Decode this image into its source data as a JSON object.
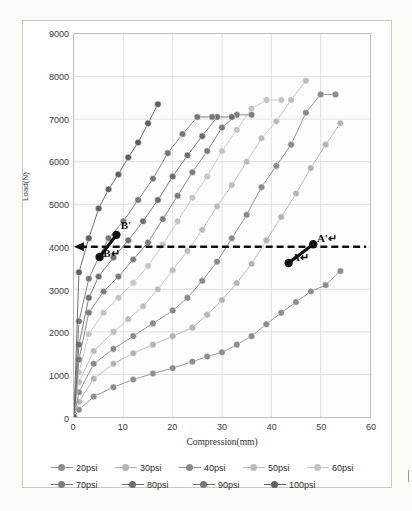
{
  "scan_artifact_text": "",
  "chart_data": {
    "type": "line",
    "title": "",
    "xlabel": "Compression(mm)",
    "ylabel": "Load(N)",
    "xlim": [
      0,
      60
    ],
    "ylim": [
      0,
      9000
    ],
    "xticks": [
      0,
      10,
      20,
      30,
      40,
      50,
      60
    ],
    "yticks": [
      0,
      1000,
      2000,
      3000,
      4000,
      5000,
      6000,
      7000,
      8000,
      9000
    ],
    "grid": true,
    "legend_position": "bottom",
    "series": [
      {
        "name": "20psi",
        "color": "#8d8d8d",
        "x": [
          0,
          1,
          4,
          8,
          12,
          16,
          20,
          24,
          27,
          30,
          33,
          36,
          39,
          42,
          45,
          48,
          51,
          54
        ],
        "values": [
          0,
          170,
          480,
          700,
          880,
          1020,
          1150,
          1300,
          1420,
          1520,
          1700,
          1900,
          2180,
          2450,
          2700,
          2950,
          3100,
          3430
        ]
      },
      {
        "name": "30psi",
        "color": "#b4b4b4",
        "x": [
          0,
          1,
          4,
          8,
          12,
          16,
          20,
          24,
          27,
          30,
          33,
          36,
          39,
          42,
          45,
          48,
          51,
          54
        ],
        "values": [
          0,
          360,
          900,
          1250,
          1500,
          1700,
          1900,
          2100,
          2400,
          2750,
          3150,
          3600,
          4150,
          4700,
          5250,
          5850,
          6400,
          6900
        ]
      },
      {
        "name": "40psi",
        "color": "#8a8a8a",
        "x": [
          0,
          1,
          4,
          8,
          12,
          16,
          20,
          23,
          26,
          29,
          32,
          35,
          38,
          41,
          44,
          47,
          50,
          53
        ],
        "values": [
          0,
          580,
          1250,
          1600,
          1900,
          2200,
          2500,
          2800,
          3200,
          3650,
          4200,
          4750,
          5400,
          5900,
          6400,
          7150,
          7580,
          7580
        ]
      },
      {
        "name": "50psi",
        "color": "#bdbdbd",
        "x": [
          0,
          1,
          4,
          8,
          11,
          14,
          17,
          20,
          23,
          26,
          29,
          32,
          35,
          38,
          41,
          44,
          47
        ],
        "values": [
          0,
          820,
          1550,
          2000,
          2300,
          2600,
          3000,
          3450,
          3900,
          4400,
          4950,
          5450,
          6000,
          6550,
          6950,
          7450,
          7900
        ]
      },
      {
        "name": "60psi",
        "color": "#c4c4c4",
        "x": [
          0,
          1,
          3,
          6,
          9,
          12,
          15,
          18,
          21,
          24,
          27,
          30,
          33,
          36,
          39,
          42
        ],
        "values": [
          0,
          1050,
          1950,
          2450,
          2800,
          3150,
          3550,
          4050,
          4600,
          5150,
          5650,
          6250,
          6750,
          7250,
          7450,
          7450
        ]
      },
      {
        "name": "70psi",
        "color": "#7c7c7c",
        "x": [
          0,
          1,
          3,
          6,
          9,
          12,
          15,
          18,
          21,
          24,
          27,
          30,
          33,
          36
        ],
        "values": [
          0,
          1350,
          2450,
          2950,
          3300,
          3700,
          4100,
          4650,
          5200,
          5750,
          6250,
          6800,
          7100,
          7100
        ]
      },
      {
        "name": "80psi",
        "color": "#6e6e6e",
        "x": [
          0,
          1,
          3,
          5,
          8,
          11,
          14,
          17,
          20,
          23,
          26,
          29,
          32
        ],
        "values": [
          0,
          1700,
          2800,
          3300,
          3750,
          4150,
          4600,
          5100,
          5650,
          6150,
          6600,
          7050,
          7050
        ]
      },
      {
        "name": "90psi",
        "color": "#777777",
        "x": [
          0,
          1,
          3,
          5,
          7,
          10,
          13,
          16,
          19,
          22,
          25,
          28
        ],
        "values": [
          0,
          2250,
          3250,
          3750,
          4200,
          4600,
          5100,
          5600,
          6200,
          6650,
          7050,
          7050
        ]
      },
      {
        "name": "100psi",
        "color": "#5f5f5f",
        "x": [
          0,
          1,
          3,
          5,
          7,
          9,
          11,
          13,
          15,
          17
        ],
        "values": [
          0,
          3400,
          4200,
          4900,
          5350,
          5700,
          6100,
          6450,
          6900,
          7350
        ]
      }
    ],
    "reference_line": {
      "label": "",
      "y": 4000,
      "style": "dashed",
      "color": "#111111",
      "arrow": "left"
    },
    "annotations": [
      {
        "label": "A↵",
        "x": 43.5,
        "y": 3620
      },
      {
        "label": "A'↵",
        "x": 48.5,
        "y": 4060
      },
      {
        "label": "B↵",
        "x": 5.5,
        "y": 3720
      },
      {
        "label": "B'",
        "x": 9.0,
        "y": 4380
      }
    ],
    "highlight_segments": [
      {
        "name": "segment-A",
        "x1": 43.5,
        "y1": 3620,
        "x2": 48.5,
        "y2": 4060,
        "color": "#111111"
      },
      {
        "name": "segment-B",
        "x1": 5.2,
        "y1": 3760,
        "x2": 8.6,
        "y2": 4280,
        "color": "#111111"
      }
    ]
  },
  "legend": {
    "rows": [
      [
        {
          "label": "20psi",
          "color": "#8d8d8d"
        },
        {
          "label": "30psi",
          "color": "#b4b4b4"
        },
        {
          "label": "40psi",
          "color": "#8a8a8a"
        },
        {
          "label": "50psi",
          "color": "#bdbdbd"
        },
        {
          "label": "60psi",
          "color": "#c4c4c4"
        }
      ],
      [
        {
          "label": "70psi",
          "color": "#7c7c7c"
        },
        {
          "label": "80psi",
          "color": "#6e6e6e"
        },
        {
          "label": "90psi",
          "color": "#777777"
        },
        {
          "label": "100psi",
          "color": "#5f5f5f"
        }
      ]
    ]
  }
}
